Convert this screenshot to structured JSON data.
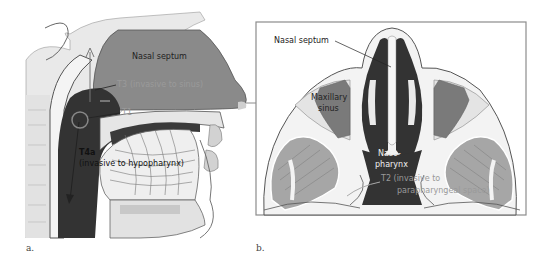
{
  "figure": {
    "panels": [
      {
        "id": "a",
        "caption": "a.",
        "view": "sagittal",
        "labels": {
          "nasal_septum": "Nasal septum",
          "t3": "T3",
          "t3_desc": "(invasive to sinus)",
          "t1": "T1",
          "t4a": "T4a",
          "t4a_desc": "(invasive to hypopharynx)"
        }
      },
      {
        "id": "b",
        "caption": "b.",
        "view": "axial",
        "labels": {
          "nasal_septum": "Nasal septum",
          "maxillary_sinus_1": "Maxillary",
          "maxillary_sinus_2": "sinus",
          "nasopharynx_1": "Naso-",
          "nasopharynx_2": "pharynx",
          "t2": "T2 (invasive to",
          "t2_desc": "parapharyngeal space)"
        }
      }
    ],
    "colors": {
      "tumor": "#333333",
      "septum_fill": "#8a8a8a",
      "sinus_fill": "#7a7a7a",
      "muscle": "#999999",
      "bone": "#d8d8d8",
      "outline": "#555555",
      "frame": "#8c8c8c",
      "grey_label": "#9a9a9a",
      "dark_label": "#222222",
      "light_label": "#f0f0f0"
    }
  }
}
